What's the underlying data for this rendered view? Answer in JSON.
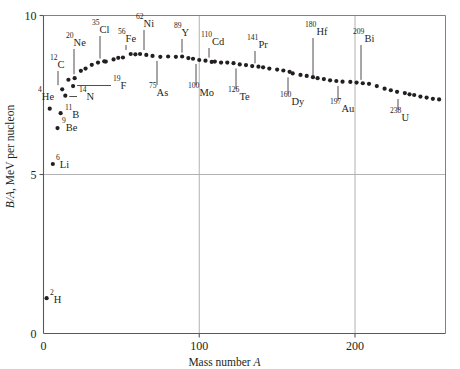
{
  "chart_data": {
    "type": "scatter",
    "title": "",
    "xlabel": "Mass number A",
    "ylabel": "B/A, MeV per nucleon",
    "ylabel_italic_part": "B/A",
    "ylabel_roman_part": ", MeV per nucleon",
    "xlim": [
      0,
      258
    ],
    "ylim": [
      0,
      10
    ],
    "xticks": [
      0,
      100,
      200
    ],
    "xticklabels": [
      "0",
      "100",
      "200"
    ],
    "yticks": [
      0,
      5,
      10
    ],
    "yticklabels": [
      "0",
      "5",
      "10"
    ],
    "grid": true,
    "legend": "none",
    "point_color": "#231f20",
    "series": [
      {
        "name": "Binding energy per nucleon",
        "points": [
          {
            "A": 2,
            "BA": 1.11
          },
          {
            "A": 6,
            "BA": 5.33
          },
          {
            "A": 9,
            "BA": 6.46
          },
          {
            "A": 11,
            "BA": 6.93
          },
          {
            "A": 4,
            "BA": 7.07
          },
          {
            "A": 14,
            "BA": 7.48
          },
          {
            "A": 19,
            "BA": 7.78
          },
          {
            "A": 12,
            "BA": 7.68
          },
          {
            "A": 16,
            "BA": 7.98
          },
          {
            "A": 20,
            "BA": 8.03
          },
          {
            "A": 24,
            "BA": 8.26
          },
          {
            "A": 27,
            "BA": 8.33
          },
          {
            "A": 31,
            "BA": 8.45
          },
          {
            "A": 35,
            "BA": 8.52
          },
          {
            "A": 39,
            "BA": 8.56
          },
          {
            "A": 40,
            "BA": 8.55
          },
          {
            "A": 45,
            "BA": 8.62
          },
          {
            "A": 48,
            "BA": 8.67
          },
          {
            "A": 51,
            "BA": 8.68
          },
          {
            "A": 56,
            "BA": 8.79
          },
          {
            "A": 59,
            "BA": 8.78
          },
          {
            "A": 62,
            "BA": 8.79
          },
          {
            "A": 66,
            "BA": 8.76
          },
          {
            "A": 70,
            "BA": 8.73
          },
          {
            "A": 75,
            "BA": 8.7
          },
          {
            "A": 80,
            "BA": 8.71
          },
          {
            "A": 85,
            "BA": 8.7
          },
          {
            "A": 89,
            "BA": 8.71
          },
          {
            "A": 93,
            "BA": 8.66
          },
          {
            "A": 96,
            "BA": 8.64
          },
          {
            "A": 100,
            "BA": 8.6
          },
          {
            "A": 104,
            "BA": 8.58
          },
          {
            "A": 108,
            "BA": 8.54
          },
          {
            "A": 110,
            "BA": 8.55
          },
          {
            "A": 114,
            "BA": 8.52
          },
          {
            "A": 118,
            "BA": 8.52
          },
          {
            "A": 122,
            "BA": 8.5
          },
          {
            "A": 126,
            "BA": 8.46
          },
          {
            "A": 130,
            "BA": 8.44
          },
          {
            "A": 134,
            "BA": 8.41
          },
          {
            "A": 138,
            "BA": 8.39
          },
          {
            "A": 141,
            "BA": 8.37
          },
          {
            "A": 145,
            "BA": 8.33
          },
          {
            "A": 150,
            "BA": 8.3
          },
          {
            "A": 154,
            "BA": 8.27
          },
          {
            "A": 158,
            "BA": 8.23
          },
          {
            "A": 160,
            "BA": 8.18
          },
          {
            "A": 165,
            "BA": 8.13
          },
          {
            "A": 169,
            "BA": 8.1
          },
          {
            "A": 173,
            "BA": 8.06
          },
          {
            "A": 176,
            "BA": 8.03
          },
          {
            "A": 180,
            "BA": 8.0
          },
          {
            "A": 184,
            "BA": 7.96
          },
          {
            "A": 188,
            "BA": 7.94
          },
          {
            "A": 192,
            "BA": 7.92
          },
          {
            "A": 197,
            "BA": 7.91
          },
          {
            "A": 201,
            "BA": 7.89
          },
          {
            "A": 205,
            "BA": 7.87
          },
          {
            "A": 209,
            "BA": 7.85
          },
          {
            "A": 214,
            "BA": 7.78
          },
          {
            "A": 219,
            "BA": 7.7
          },
          {
            "A": 223,
            "BA": 7.65
          },
          {
            "A": 227,
            "BA": 7.6
          },
          {
            "A": 232,
            "BA": 7.56
          },
          {
            "A": 235,
            "BA": 7.52
          },
          {
            "A": 238,
            "BA": 7.5
          },
          {
            "A": 242,
            "BA": 7.45
          },
          {
            "A": 246,
            "BA": 7.42
          },
          {
            "A": 250,
            "BA": 7.38
          },
          {
            "A": 254,
            "BA": 7.36
          }
        ]
      }
    ],
    "annotations": [
      {
        "mass": "2",
        "element": "H",
        "A": 2,
        "BA": 1.11,
        "label_x": 50,
        "label_y": 303,
        "leader": "none"
      },
      {
        "mass": "6",
        "element": "Li",
        "A": 6,
        "BA": 5.33,
        "label_x": 56,
        "label_y": 168,
        "leader": "none"
      },
      {
        "mass": "9",
        "element": "Be",
        "A": 9,
        "BA": 6.46,
        "label_x": 62,
        "label_y": 131,
        "leader": "none"
      },
      {
        "mass": "4",
        "element": "He",
        "A": 4,
        "BA": 7.07,
        "label_x": 38,
        "label_y": 100,
        "leader": "none"
      },
      {
        "mass": "11",
        "element": "B",
        "A": 11,
        "BA": 6.93,
        "label_x": 65,
        "label_y": 118,
        "leader": "none"
      },
      {
        "mass": "14",
        "element": "N",
        "A": 14,
        "BA": 7.48,
        "label_x": 79,
        "label_y": 100,
        "leader": "horizontal"
      },
      {
        "mass": "12",
        "element": "C",
        "A": 12,
        "BA": 7.68,
        "label_x": 50,
        "label_y": 68,
        "leader": "vertical"
      },
      {
        "mass": "19",
        "element": "F",
        "A": 19,
        "BA": 7.78,
        "label_x": 113,
        "label_y": 89,
        "leader": "horizontal"
      },
      {
        "mass": "20",
        "element": "Ne",
        "A": 20,
        "BA": 8.03,
        "label_x": 66,
        "label_y": 46,
        "leader": "vertical"
      },
      {
        "mass": "35",
        "element": "Cl",
        "A": 35,
        "BA": 8.52,
        "label_x": 92,
        "label_y": 33,
        "leader": "vertical"
      },
      {
        "mass": "56",
        "element": "Fe",
        "A": 56,
        "BA": 8.79,
        "label_x": 118,
        "label_y": 42,
        "leader": "vertical"
      },
      {
        "mass": "62",
        "element": "Ni",
        "A": 62,
        "BA": 8.79,
        "label_x": 136,
        "label_y": 27,
        "leader": "vertical"
      },
      {
        "mass": "75",
        "element": "As",
        "A": 75,
        "BA": 8.7,
        "label_x": 149,
        "label_y": 96,
        "leader": "vertical"
      },
      {
        "mass": "89",
        "element": "Y",
        "A": 89,
        "BA": 8.71,
        "label_x": 174,
        "label_y": 36,
        "leader": "vertical"
      },
      {
        "mass": "100",
        "element": "Mo",
        "A": 100,
        "BA": 8.6,
        "label_x": 188,
        "label_y": 96,
        "leader": "vertical"
      },
      {
        "mass": "110",
        "element": "Cd",
        "A": 110,
        "BA": 8.55,
        "label_x": 201,
        "label_y": 45,
        "leader": "vertical"
      },
      {
        "mass": "126",
        "element": "Te",
        "A": 126,
        "BA": 8.46,
        "label_x": 228,
        "label_y": 100,
        "leader": "vertical"
      },
      {
        "mass": "141",
        "element": "Pr",
        "A": 141,
        "BA": 8.37,
        "label_x": 247,
        "label_y": 48,
        "leader": "vertical"
      },
      {
        "mass": "160",
        "element": "Dy",
        "A": 160,
        "BA": 8.18,
        "label_x": 280,
        "label_y": 105,
        "leader": "vertical"
      },
      {
        "mass": "180",
        "element": "Hf",
        "A": 180,
        "BA": 8.0,
        "label_x": 305,
        "label_y": 35,
        "leader": "vertical"
      },
      {
        "mass": "197",
        "element": "Au",
        "A": 197,
        "BA": 7.91,
        "label_x": 330,
        "label_y": 112,
        "leader": "vertical"
      },
      {
        "mass": "209",
        "element": "Bi",
        "A": 209,
        "BA": 7.85,
        "label_x": 353,
        "label_y": 42,
        "leader": "vertical"
      },
      {
        "mass": "238",
        "element": "U",
        "A": 238,
        "BA": 7.5,
        "label_x": 390,
        "label_y": 121,
        "leader": "vertical"
      }
    ]
  }
}
